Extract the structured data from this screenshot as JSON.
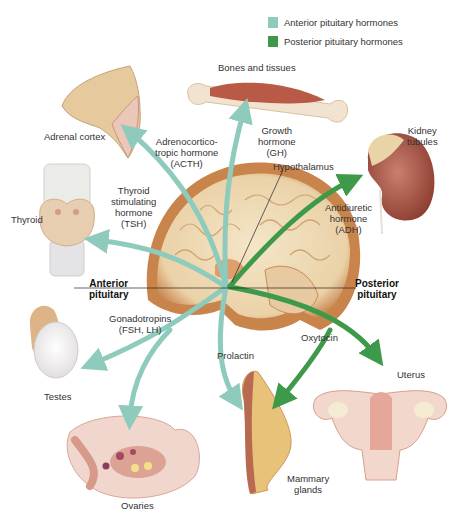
{
  "legend": {
    "items": [
      {
        "label": "Anterior pituitary hormones",
        "color": "#8fcbbd"
      },
      {
        "label": "Posterior pituitary hormones",
        "color": "#3e9a4a"
      }
    ]
  },
  "labels": {
    "bones_and_tissues": "Bones and tissues",
    "adrenal_cortex": "Adrenal cortex",
    "acth": [
      "Adrenocortico-",
      "tropic hormone",
      "(ACTH)"
    ],
    "gh": [
      "Growth",
      "hormone",
      "(GH)"
    ],
    "kidney_tubules": [
      "Kidney",
      "tubules"
    ],
    "hypothalamus": "Hypothalamus",
    "tsh": [
      "Thyroid",
      "stimulating",
      "hormone",
      "(TSH)"
    ],
    "thyroid": "Thyroid",
    "adh": [
      "Antidiuretic",
      "hormone",
      "(ADH)"
    ],
    "anterior_pituitary": [
      "Anterior",
      "pituitary"
    ],
    "posterior_pituitary": [
      "Posterior",
      "pituitary"
    ],
    "gonadotropins": [
      "Gonadotropins",
      "(FSH, LH)"
    ],
    "prolactin": "Prolactin",
    "oxytocin": "Oxytocin",
    "uterus": "Uterus",
    "testes": "Testes",
    "mammary_glands": [
      "Mammary",
      "glands"
    ],
    "ovaries": "Ovaries"
  },
  "colors": {
    "anterior_arrow": "#8fcbbd",
    "posterior_arrow": "#3e9a4a",
    "tissue": "#e9c9a3",
    "brain": "#f1dfc0"
  }
}
